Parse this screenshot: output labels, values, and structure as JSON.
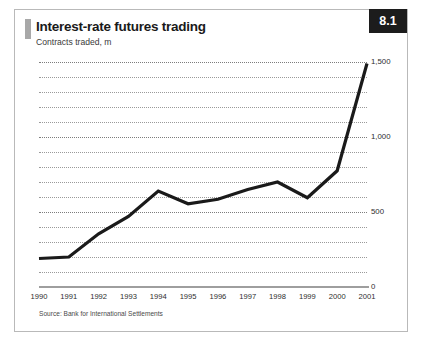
{
  "figure": {
    "number_badge": "8.1",
    "title": "Interest-rate futures trading",
    "subtitle": "Contracts traded, m",
    "source": "Source: Bank for International Settlements"
  },
  "chart_data": {
    "type": "line",
    "title": "Interest-rate futures trading",
    "subtitle": "Contracts traded, m",
    "xlabel": "",
    "ylabel": "Contracts traded, m",
    "categories": [
      "1990",
      "1991",
      "1992",
      "1993",
      "1994",
      "1995",
      "1996",
      "1997",
      "1998",
      "1999",
      "2000",
      "2001"
    ],
    "values": [
      190,
      200,
      355,
      470,
      640,
      555,
      585,
      650,
      700,
      595,
      775,
      1490
    ],
    "ylim": [
      0,
      1500
    ],
    "yticks": [
      0,
      500,
      1000,
      1500
    ],
    "ytick_labels": [
      "0",
      "500",
      "1,000",
      "1,500"
    ],
    "minor_gridline_step": 100,
    "grid": true,
    "grid_style": "dotted",
    "legend": false,
    "line_color": "#1a1a1a",
    "line_width": 3.2,
    "source": "Source: Bank for International Settlements"
  }
}
